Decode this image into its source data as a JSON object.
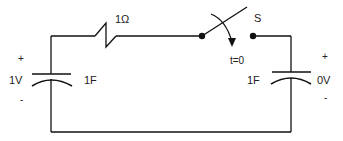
{
  "diagram": {
    "type": "circuit",
    "components": {
      "resistor": {
        "label": "1Ω",
        "value_ohms": 1
      },
      "switch": {
        "label": "S",
        "timing_label": "t=0"
      },
      "left_capacitor": {
        "label": "1F",
        "voltage_label": "1V",
        "plus": "+",
        "minus": "-"
      },
      "right_capacitor": {
        "label": "1F",
        "voltage_label": "0V",
        "plus": "+",
        "minus": "-"
      }
    },
    "colors": {
      "wire": "#111111",
      "text": "#222222",
      "background": "#ffffff"
    }
  }
}
